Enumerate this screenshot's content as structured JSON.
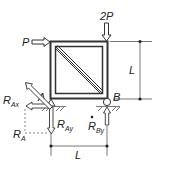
{
  "diagram": {
    "type": "statics free-body diagram",
    "labels": {
      "load_horizontal": "P",
      "load_vertical": "2P",
      "height_dim": "L",
      "width_dim": "L",
      "support_a": "A",
      "support_b": "B",
      "reaction_ax": {
        "base": "R",
        "sub": "Ax"
      },
      "reaction_ay": {
        "base": "R",
        "sub": "Ay"
      },
      "reaction_a": {
        "base": "R",
        "sub": "A"
      },
      "reaction_by": {
        "base": "R",
        "sub": "By"
      }
    },
    "colors": {
      "line": "#333333",
      "hatch": "#555555"
    }
  }
}
